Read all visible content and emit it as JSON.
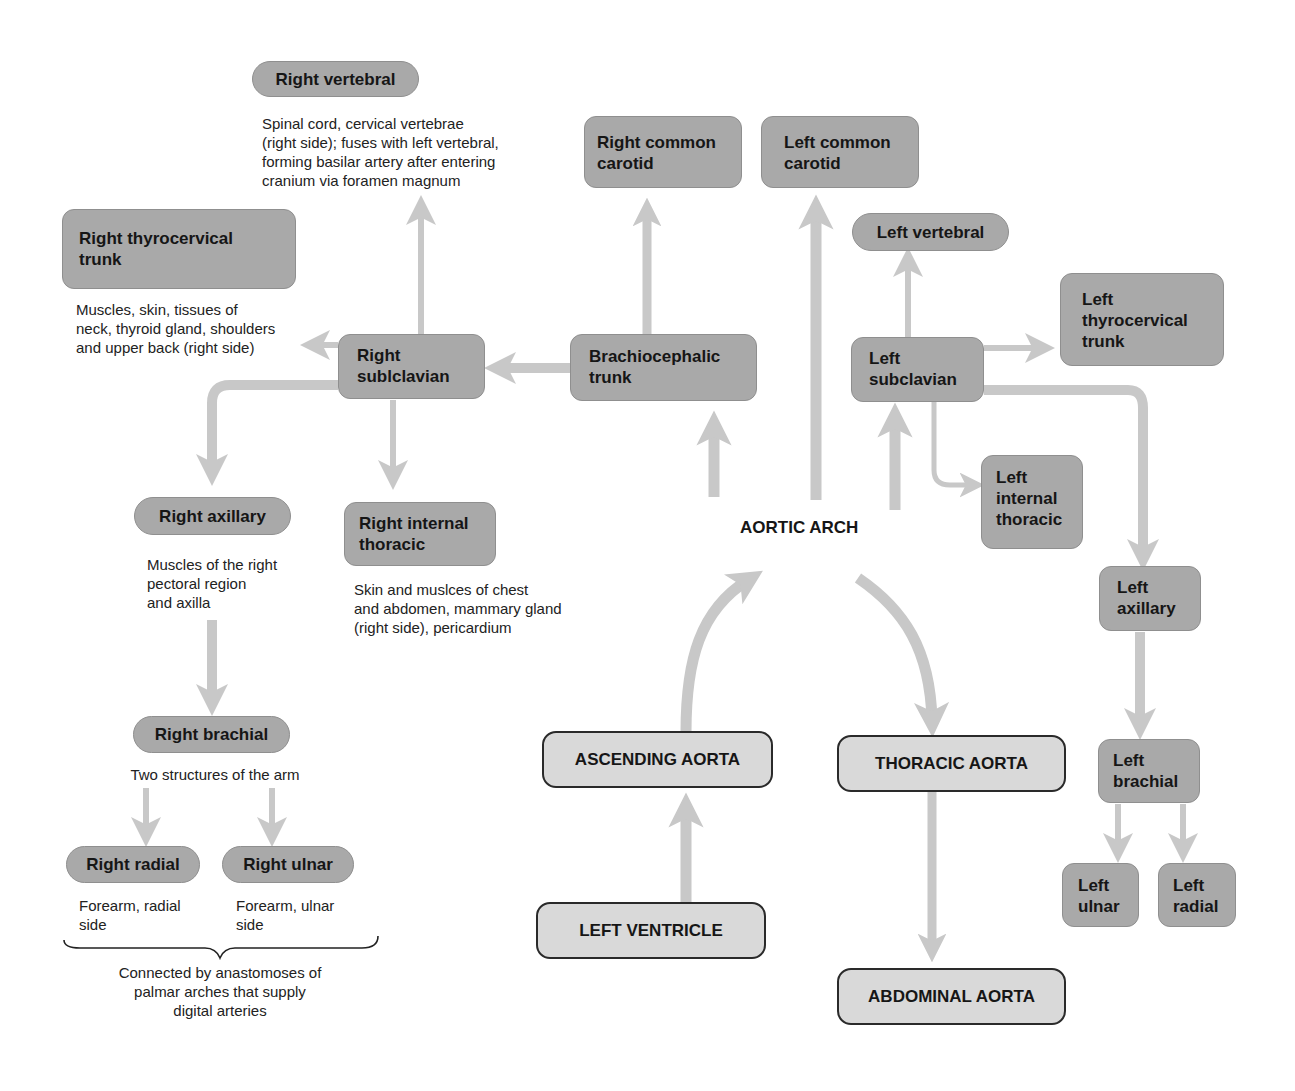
{
  "title_label": "AORTIC ARCH",
  "colors": {
    "branch_box": "#a9a9a9",
    "aorta_box": "#d9d9d9",
    "arrow": "#c8c8c8",
    "text": "#161616"
  },
  "aorta": {
    "left_ventricle": "LEFT VENTRICLE",
    "ascending": "ASCENDING AORTA",
    "arch": "AORTIC ARCH",
    "thoracic": "THORACIC AORTA",
    "abdominal": "ABDOMINAL AORTA"
  },
  "right": {
    "vertebral": {
      "label": "Right vertebral",
      "note": "Spinal cord, cervical vertebrae\n(right side); fuses with left vertebral,\nforming basilar artery after entering\ncranium via foramen magnum"
    },
    "thyrocervical": {
      "label": "Right thyrocervical\ntrunk",
      "note": "Muscles, skin, tissues of\nneck, thyroid gland, shoulders\nand upper back (right side)"
    },
    "common_carotid": {
      "label": "Right common\ncarotid"
    },
    "brachiocephalic": {
      "label": "Brachiocephalic\ntrunk"
    },
    "subclavian": {
      "label": "Right\nsublclavian"
    },
    "axillary": {
      "label": "Right axillary",
      "note": "Muscles of the right\npectoral region\nand axilla"
    },
    "internal_thoracic": {
      "label": "Right internal\nthoracic",
      "note": "Skin and muslces of chest\nand abdomen, mammary gland\n(right side), pericardium"
    },
    "brachial": {
      "label": "Right brachial",
      "note": "Two structures of the arm"
    },
    "radial": {
      "label": "Right radial",
      "note": "Forearm, radial\nside"
    },
    "ulnar": {
      "label": "Right ulnar",
      "note": "Forearm, ulnar\nside"
    },
    "palmar_note": "Connected by anastomoses of\npalmar arches that supply\ndigital arteries"
  },
  "left": {
    "common_carotid": {
      "label": "Left common\ncarotid"
    },
    "vertebral": {
      "label": "Left vertebral"
    },
    "thyrocervical": {
      "label": "Left\nthyrocervical\ntrunk"
    },
    "subclavian": {
      "label": "Left\nsubclavian"
    },
    "internal_thoracic": {
      "label": "Left\ninternal\nthoracic"
    },
    "axillary": {
      "label": "Left\naxillary"
    },
    "brachial": {
      "label": "Left\nbrachial"
    },
    "ulnar": {
      "label": "Left\nulnar"
    },
    "radial": {
      "label": "Left\nradial"
    }
  }
}
